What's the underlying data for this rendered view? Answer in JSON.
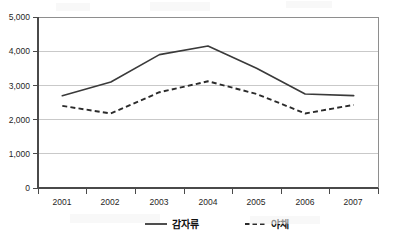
{
  "chart_data": {
    "type": "line",
    "title": "",
    "xlabel": "",
    "ylabel": "",
    "categories": [
      "2001",
      "2002",
      "2003",
      "2004",
      "2005",
      "2006",
      "2007"
    ],
    "series": [
      {
        "name": "감자류",
        "style": "solid",
        "color": "#3a3a3a",
        "values": [
          2700,
          3100,
          3900,
          4150,
          3500,
          2750,
          2700
        ]
      },
      {
        "name": "야채",
        "style": "dashed",
        "color": "#2b2b2b",
        "values": [
          2400,
          2180,
          2800,
          3120,
          2750,
          2180,
          2430
        ]
      }
    ],
    "ylim": [
      0,
      5000
    ],
    "ytick_values": [
      0,
      1000,
      2000,
      3000,
      4000,
      5000
    ],
    "ytick_labels": [
      "0",
      "1,000",
      "2,000",
      "3,000",
      "4,000",
      "5,000"
    ],
    "grid": true,
    "legend_position": "bottom"
  },
  "legend": {
    "entries": [
      {
        "label": "감자류",
        "style": "solid"
      },
      {
        "label": "야채",
        "style": "dashed"
      }
    ]
  },
  "axes": {
    "y_labels": [
      "5,000",
      "4,000",
      "3,000",
      "2,000",
      "1,000",
      "0"
    ],
    "x_labels": [
      "2001",
      "2002",
      "2003",
      "2004",
      "2005",
      "2006",
      "2007"
    ]
  }
}
